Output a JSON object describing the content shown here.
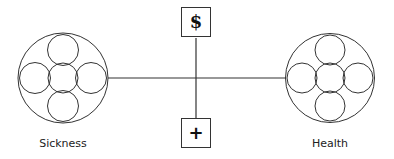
{
  "diagram": {
    "left_node": {
      "label": "Sickness"
    },
    "right_node": {
      "label": "Health"
    },
    "top_box": {
      "symbol": "$",
      "meaning": "dollar-icon"
    },
    "bottom_box": {
      "symbol": "+",
      "meaning": "plus-icon"
    },
    "colors": {
      "stroke": "#333333",
      "background": "#ffffff"
    }
  }
}
